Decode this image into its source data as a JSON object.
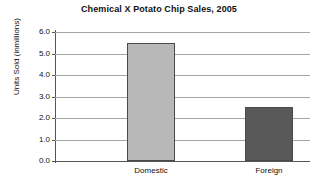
{
  "chart_data": {
    "type": "bar",
    "title": "Chemical X Potato Chip Sales, 2005",
    "xlabel": "",
    "ylabel": "Units Sold (inmillions)",
    "categories": [
      "Domestic",
      "Foreign"
    ],
    "values": [
      5.5,
      2.5
    ],
    "ylim": [
      0.0,
      6.0
    ],
    "ytick_labels": [
      "6.0",
      "5.0",
      "4.0",
      "3.0",
      "2.0",
      "1.0",
      "0.0"
    ],
    "ytick_values": [
      6.0,
      5.0,
      4.0,
      3.0,
      2.0,
      1.0,
      0.0
    ],
    "grid": "horizontal",
    "legend": "none",
    "bar_colors": [
      "#b8b8b8",
      "#595959"
    ],
    "bar_border_color": "#4a4a4a",
    "gridline_color": "#a6a6a6",
    "axis_color": "#555555"
  }
}
